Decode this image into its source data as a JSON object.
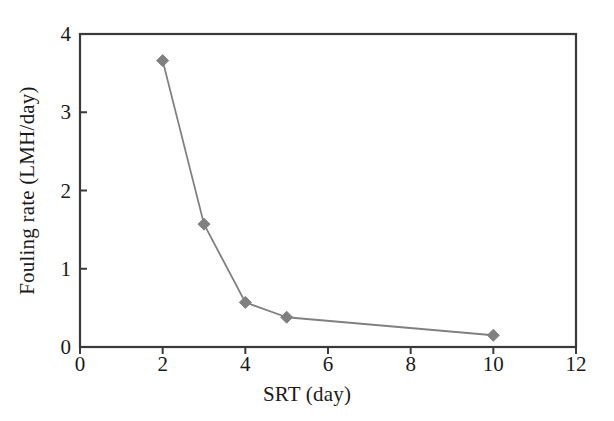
{
  "figure": {
    "background_color": "#ffffff",
    "plot_box": {
      "left": 80,
      "top": 34,
      "right": 576,
      "bottom": 347
    },
    "border_color": "#3a3a3a",
    "series_color": "#808080",
    "text_color": "#1a1a1a"
  },
  "chart_data": {
    "type": "line",
    "title": "",
    "subtitle": "",
    "xlabel": "SRT (day)",
    "ylabel": "Fouling rate (LMH/day)",
    "xlim": [
      0,
      12
    ],
    "ylim": [
      0,
      4
    ],
    "xticks": [
      0,
      2,
      4,
      6,
      8,
      10,
      12
    ],
    "xtick_labels": [
      "0",
      "2",
      "4",
      "6",
      "8",
      "10",
      "12"
    ],
    "yticks": [
      0,
      1,
      2,
      3,
      4
    ],
    "ytick_labels": [
      "0",
      "1",
      "2",
      "3",
      "4"
    ],
    "grid": false,
    "legend": null,
    "legend_position": "none",
    "marker": "diamond",
    "marker_color": "#808080",
    "line_color": "#808080",
    "x": [
      2,
      3,
      4,
      5,
      10
    ],
    "values": [
      3.66,
      1.57,
      0.57,
      0.38,
      0.15
    ],
    "series": [
      {
        "name": "Fouling rate",
        "x": [
          2,
          3,
          4,
          5,
          10
        ],
        "values": [
          3.66,
          1.57,
          0.57,
          0.38,
          0.15
        ]
      }
    ],
    "annotations": []
  }
}
